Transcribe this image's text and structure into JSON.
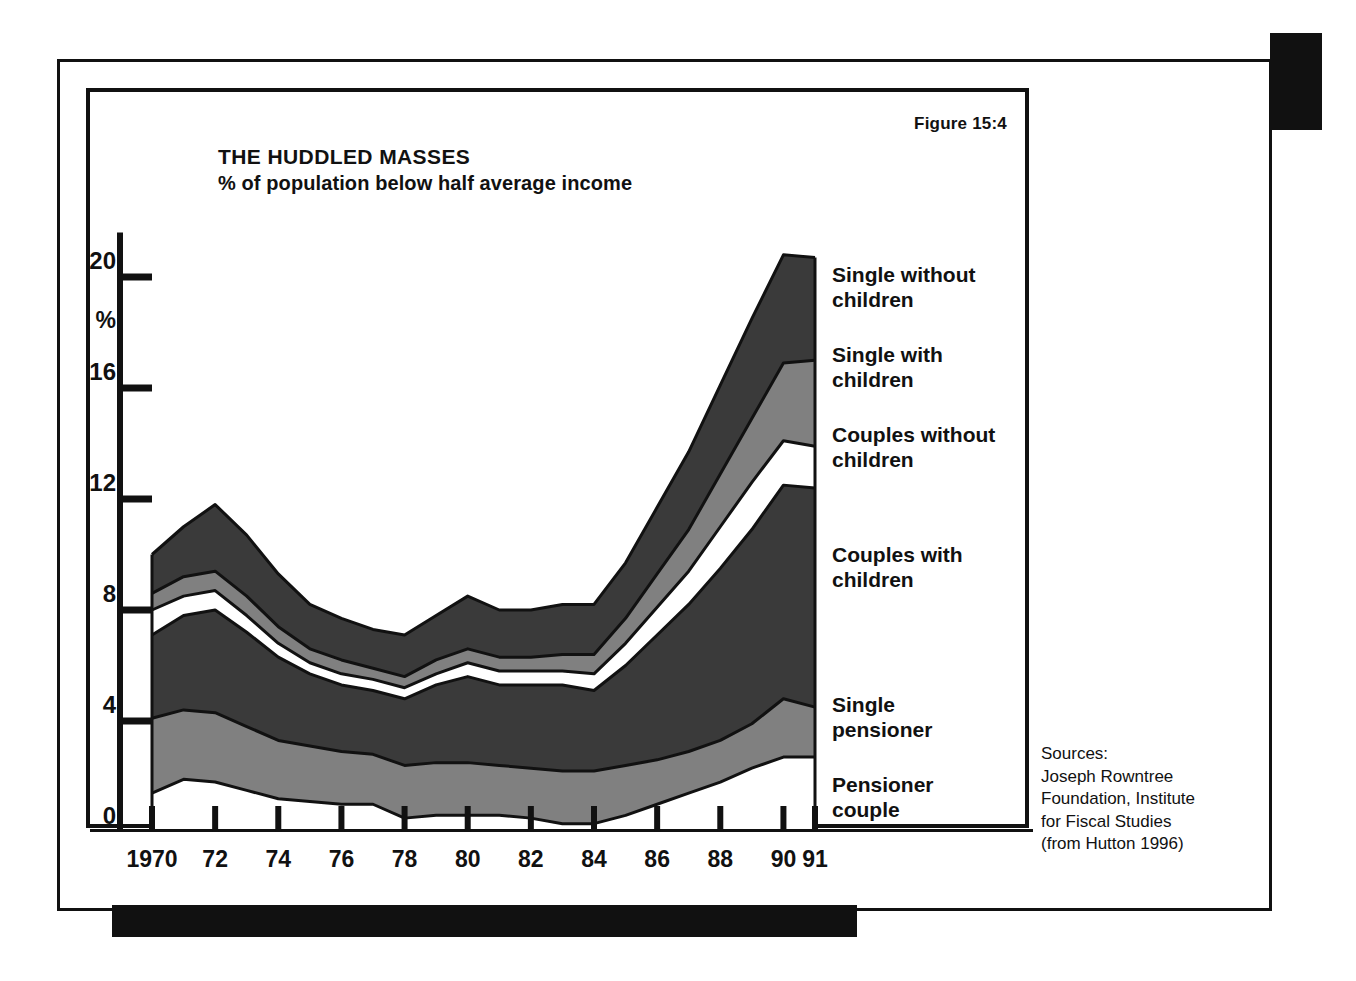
{
  "figure_label": "Figure 15:4",
  "title": {
    "main": "THE HUDDLED MASSES",
    "sub": "% of population below half average income"
  },
  "sources": "Sources:\nJoseph Rowntree\nFoundation, Institute\nfor Fiscal Studies\n(from Hutton 1996)",
  "colors": {
    "ink": "#111111",
    "dark_band": "#3a3a3a",
    "mid_band": "#808080",
    "light_band": "#ffffff",
    "background": "#ffffff"
  },
  "legend": [
    {
      "label": "Single without\nchildren",
      "swatch": "#3a3a3a"
    },
    {
      "label": "Single with\nchildren",
      "swatch": "#808080"
    },
    {
      "label": "Couples without\nchildren",
      "swatch": "#ffffff"
    },
    {
      "label": "Couples with\nchildren",
      "swatch": "#3a3a3a"
    },
    {
      "label": "Single\npensioner",
      "swatch": "#808080"
    },
    {
      "label": "Pensioner\ncouple",
      "swatch": "#ffffff"
    }
  ],
  "chart_data": {
    "type": "area",
    "stacked": true,
    "title": "THE HUDDLED MASSES",
    "subtitle": "% of population below half average income",
    "xlabel": "",
    "ylabel": "%",
    "ylim": [
      0,
      22
    ],
    "yticks": [
      0,
      4,
      8,
      12,
      16,
      20
    ],
    "ytick_labels": [
      "0",
      "4",
      "8",
      "12",
      "16",
      "20"
    ],
    "grid": false,
    "legend_position": "right",
    "x": [
      1970,
      1971,
      1972,
      1973,
      1974,
      1975,
      1976,
      1977,
      1978,
      1979,
      1980,
      1981,
      1982,
      1983,
      1984,
      1985,
      1986,
      1987,
      1988,
      1989,
      1990,
      1991
    ],
    "xtick_values": [
      1970,
      1972,
      1974,
      1976,
      1978,
      1980,
      1982,
      1984,
      1986,
      1988,
      1990,
      1991
    ],
    "xtick_labels": [
      "1970",
      "72",
      "74",
      "76",
      "78",
      "80",
      "82",
      "84",
      "86",
      "88",
      "90",
      "91"
    ],
    "series": [
      {
        "name": "Pensioner couple",
        "values": [
          1.4,
          1.9,
          1.8,
          1.5,
          1.2,
          1.1,
          1.0,
          1.0,
          0.5,
          0.6,
          0.6,
          0.6,
          0.5,
          0.3,
          0.3,
          0.6,
          1.0,
          1.4,
          1.8,
          2.3,
          2.7,
          2.7
        ]
      },
      {
        "name": "Single pensioner",
        "values": [
          2.7,
          2.5,
          2.5,
          2.3,
          2.1,
          2.0,
          1.9,
          1.8,
          1.9,
          1.9,
          1.9,
          1.8,
          1.8,
          1.9,
          1.9,
          1.8,
          1.6,
          1.5,
          1.5,
          1.6,
          2.1,
          1.8
        ]
      },
      {
        "name": "Couples with children",
        "values": [
          3.0,
          3.4,
          3.7,
          3.4,
          3.0,
          2.6,
          2.4,
          2.3,
          2.4,
          2.8,
          3.1,
          2.9,
          3.0,
          3.1,
          2.9,
          3.6,
          4.5,
          5.3,
          6.2,
          7.0,
          7.7,
          7.9
        ]
      },
      {
        "name": "Couples without children",
        "values": [
          0.9,
          0.7,
          0.7,
          0.6,
          0.5,
          0.4,
          0.4,
          0.4,
          0.4,
          0.4,
          0.5,
          0.5,
          0.5,
          0.5,
          0.6,
          0.8,
          1.0,
          1.2,
          1.5,
          1.7,
          1.6,
          1.5
        ]
      },
      {
        "name": "Single with children",
        "values": [
          0.6,
          0.7,
          0.7,
          0.7,
          0.6,
          0.5,
          0.5,
          0.4,
          0.4,
          0.5,
          0.5,
          0.5,
          0.5,
          0.6,
          0.7,
          0.9,
          1.2,
          1.5,
          1.9,
          2.3,
          2.8,
          3.1
        ]
      },
      {
        "name": "Single without children",
        "values": [
          1.4,
          1.8,
          2.4,
          2.2,
          1.9,
          1.6,
          1.5,
          1.4,
          1.5,
          1.6,
          1.9,
          1.7,
          1.7,
          1.8,
          1.8,
          2.0,
          2.4,
          2.8,
          3.2,
          3.6,
          3.9,
          3.7
        ]
      }
    ],
    "totals": [
      10.0,
      11.0,
      11.8,
      10.7,
      9.3,
      8.2,
      7.7,
      7.3,
      7.1,
      7.8,
      8.5,
      8.0,
      8.0,
      8.2,
      8.2,
      9.7,
      11.7,
      13.7,
      16.1,
      18.5,
      20.8,
      20.7
    ]
  }
}
